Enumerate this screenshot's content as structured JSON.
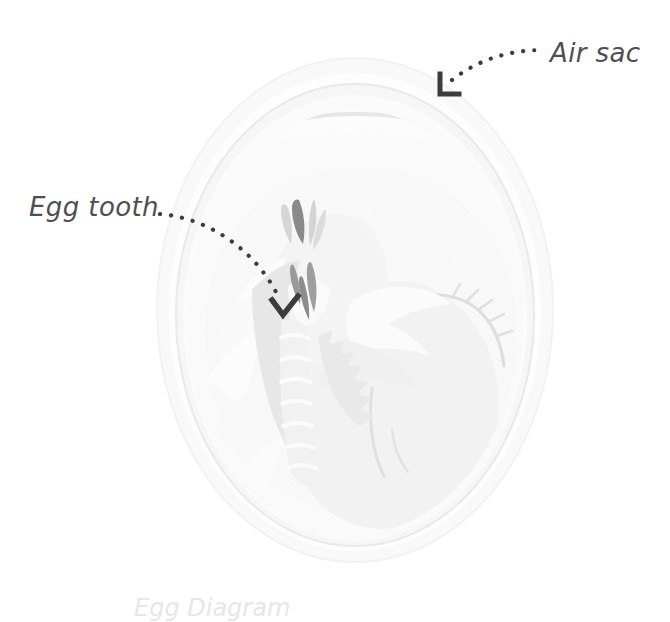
{
  "figure": {
    "background_color": "#ffffff",
    "width": 670,
    "height": 609
  },
  "callouts": [
    {
      "id": "air-sac",
      "label": "Air sac",
      "text_color": "#4f4f4f",
      "marker": "corner-bracket",
      "marker_color": "#3c3c3c",
      "leader_style": "dotted",
      "leader_color": "#3c3c3c"
    },
    {
      "id": "egg-tooth",
      "label": "Egg tooth",
      "text_color": "#4f4f4f",
      "marker": "check-bracket",
      "marker_color": "#3c3c3c",
      "leader_style": "dotted",
      "leader_color": "#3c3c3c"
    }
  ],
  "caption": {
    "text": "Egg Diagram"
  },
  "anatomy": {
    "outer_shell_color": "#f4f4f4",
    "shell_membrane_color": "#fcfcfc",
    "inner_membrane_color": "#ececec",
    "albumen_color": "#f7f7f7",
    "yolk_color": "#e6e6e6",
    "embryo_body_color": "#efefef",
    "embryo_highlight_color": "#fbfbfb",
    "feather_color": "#e2e2e2",
    "beak_dark_color": "#8e8e8e",
    "accent_dark_color": "#6f6f6f",
    "outline_color": "#d8d8d8",
    "parts": [
      "outer shell",
      "shell membrane",
      "air sac",
      "albumen",
      "yolk",
      "embryo",
      "beak",
      "egg tooth",
      "wing feathers",
      "leg"
    ]
  }
}
